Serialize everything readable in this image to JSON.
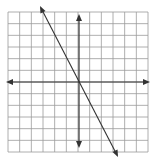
{
  "chart_data": {
    "type": "line",
    "title": "",
    "xlabel": "",
    "ylabel": "",
    "grid": true,
    "xlim": [
      -6,
      6
    ],
    "ylim": [
      -6,
      6
    ],
    "grid_cells": 12,
    "series": [
      {
        "name": "line",
        "slope": -2,
        "intercept": 0,
        "x": [
          -3.25,
          3.25
        ],
        "y": [
          6.5,
          -6.5
        ]
      }
    ],
    "arrows": {
      "x_axis": "both",
      "y_axis": "both",
      "line": "both"
    }
  },
  "colors": {
    "grid": "#9a9a9a",
    "axis": "#333333",
    "line": "#333333",
    "background": "#ffffff"
  }
}
